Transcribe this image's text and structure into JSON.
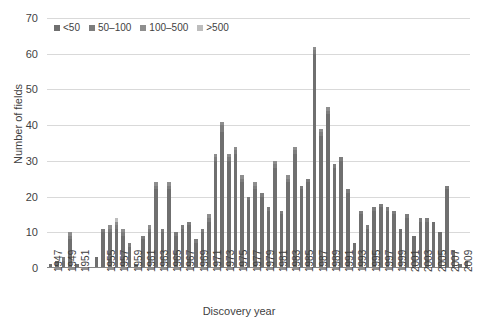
{
  "chart_data": {
    "type": "bar",
    "stacked": true,
    "title": "",
    "xlabel": "Discovery year",
    "ylabel": "Number of fields",
    "ylim": [
      0,
      70
    ],
    "ytick_step": 10,
    "yticks": [
      0,
      10,
      20,
      30,
      40,
      50,
      60,
      70
    ],
    "grid": true,
    "legend_position": "top-left",
    "legend": [
      "<50",
      "50–100",
      "100–500",
      ">500"
    ],
    "series_colors": [
      "#6f6f6f",
      "#7d7d7d",
      "#8e8e8e",
      "#bdbdbd"
    ],
    "xtick_labels": [
      "1947",
      "1949",
      "1951",
      "1955",
      "1957",
      "1959",
      "1961",
      "1963",
      "1965",
      "1967",
      "1969",
      "1971",
      "1973",
      "1975",
      "1977",
      "1979",
      "1981",
      "1983",
      "1985",
      "1987",
      "1989",
      "1991",
      "1993",
      "1995",
      "1997",
      "1999",
      "2001",
      "2003",
      "2005",
      "2007",
      "2009"
    ],
    "categories": [
      "1947",
      "1948",
      "1949",
      "1950",
      "1951",
      "1952",
      "1953",
      "1954",
      "1955",
      "1956",
      "1957",
      "1958",
      "1959",
      "1960",
      "1961",
      "1962",
      "1963",
      "1964",
      "1965",
      "1966",
      "1967",
      "1968",
      "1969",
      "1970",
      "1971",
      "1972",
      "1973",
      "1974",
      "1975",
      "1976",
      "1977",
      "1978",
      "1979",
      "1980",
      "1981",
      "1982",
      "1983",
      "1984",
      "1985",
      "1986",
      "1987",
      "1988",
      "1989",
      "1990",
      "1991",
      "1992",
      "1993",
      "1994",
      "1995",
      "1996",
      "1997",
      "1998",
      "1999",
      "2000",
      "2001",
      "2002",
      "2003",
      "2004",
      "2005",
      "2006",
      "2007",
      "2008",
      "2009",
      "2010"
    ],
    "values": [
      1,
      2,
      3,
      10,
      1,
      0,
      0,
      3,
      11,
      12,
      14,
      11,
      7,
      1,
      9,
      12,
      24,
      11,
      24,
      10,
      12,
      13,
      8,
      11,
      15,
      32,
      41,
      32,
      34,
      26,
      20,
      24,
      21,
      17,
      30,
      16,
      26,
      34,
      23,
      25,
      62,
      39,
      45,
      29,
      31,
      22,
      7,
      16,
      12,
      17,
      18,
      17,
      16,
      11,
      15,
      9,
      14,
      14,
      13,
      10,
      23,
      5,
      1,
      2
    ],
    "series": [
      {
        "name": "<50",
        "values": [
          1,
          2,
          2,
          8,
          1,
          0,
          0,
          3,
          10,
          10,
          11,
          9,
          6,
          1,
          8,
          10,
          22,
          10,
          22,
          9,
          11,
          12,
          7,
          10,
          13,
          30,
          38,
          30,
          32,
          24,
          19,
          22,
          20,
          16,
          28,
          15,
          24,
          32,
          22,
          24,
          60,
          37,
          43,
          28,
          30,
          21,
          7,
          15,
          11,
          16,
          17,
          16,
          15,
          11,
          14,
          9,
          13,
          13,
          13,
          10,
          22,
          5,
          1,
          2
        ]
      },
      {
        "name": "50–100",
        "values": [
          0,
          0,
          1,
          1,
          0,
          0,
          0,
          0,
          1,
          1,
          1,
          1,
          1,
          0,
          1,
          1,
          1,
          1,
          1,
          1,
          1,
          1,
          1,
          1,
          1,
          1,
          2,
          1,
          1,
          1,
          1,
          1,
          1,
          1,
          1,
          1,
          1,
          1,
          1,
          1,
          1,
          1,
          1,
          1,
          1,
          1,
          0,
          1,
          1,
          1,
          1,
          1,
          1,
          0,
          1,
          0,
          1,
          1,
          0,
          0,
          1,
          0,
          0,
          0
        ]
      },
      {
        "name": "100–500",
        "values": [
          0,
          0,
          0,
          1,
          0,
          0,
          0,
          0,
          0,
          1,
          1,
          1,
          0,
          0,
          0,
          1,
          1,
          0,
          1,
          0,
          0,
          0,
          0,
          0,
          1,
          1,
          1,
          1,
          1,
          1,
          0,
          1,
          0,
          0,
          1,
          0,
          1,
          1,
          0,
          0,
          1,
          1,
          1,
          0,
          0,
          0,
          0,
          0,
          0,
          0,
          0,
          0,
          0,
          0,
          0,
          0,
          0,
          0,
          0,
          0,
          0,
          0,
          0,
          0
        ]
      },
      {
        "name": ">500",
        "values": [
          0,
          0,
          0,
          0,
          0,
          0,
          0,
          0,
          0,
          0,
          1,
          0,
          0,
          0,
          0,
          0,
          0,
          0,
          0,
          0,
          0,
          0,
          0,
          0,
          0,
          0,
          0,
          0,
          0,
          0,
          0,
          0,
          0,
          0,
          0,
          0,
          0,
          0,
          0,
          0,
          0,
          0,
          0,
          0,
          0,
          0,
          0,
          0,
          0,
          0,
          0,
          0,
          0,
          0,
          0,
          0,
          0,
          0,
          0,
          0,
          0,
          0,
          0,
          0
        ]
      }
    ]
  }
}
